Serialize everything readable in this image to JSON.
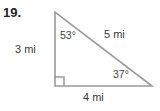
{
  "problem": {
    "number_label": "19."
  },
  "figure": {
    "type": "right-triangle-diagram",
    "stroke_color": "#9a9a9a",
    "text_color": "#3a3a3a",
    "background_color": "#ffffff",
    "vertices": {
      "top": {
        "x": 55,
        "y": 12
      },
      "bottom_left": {
        "x": 55,
        "y": 86
      },
      "bottom_right": {
        "x": 152,
        "y": 86
      }
    },
    "right_angle_marker": {
      "at": "bottom_left",
      "size": 9
    },
    "sides": [
      {
        "name": "left-leg",
        "label": "3 mi",
        "value": 3,
        "unit": "mi"
      },
      {
        "name": "bottom-leg",
        "label": "4 mi",
        "value": 4,
        "unit": "mi"
      },
      {
        "name": "hypotenuse",
        "label": "5 mi",
        "value": 5,
        "unit": "mi"
      }
    ],
    "angles": [
      {
        "name": "top-angle",
        "label": "53°",
        "value": 53
      },
      {
        "name": "bottom-right-angle",
        "label": "37°",
        "value": 37
      },
      {
        "name": "bottom-left-angle",
        "label": "",
        "value": 90
      }
    ]
  }
}
